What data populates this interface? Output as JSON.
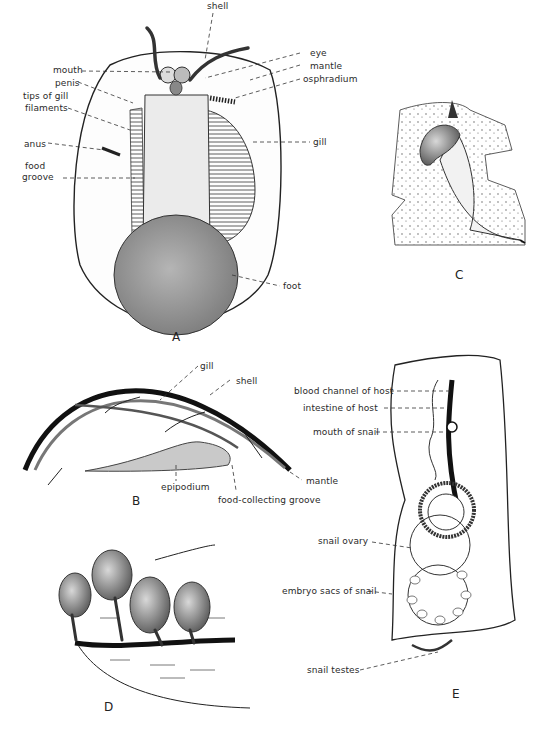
{
  "figure": {
    "panels": {
      "A": {
        "letter": "A",
        "labels": {
          "shell": "shell",
          "eye": "eye",
          "mantle": "mantle",
          "osphradium": "osphradium",
          "mouth": "mouth",
          "penis": "penis",
          "tips_line1": "tips of gill",
          "tips_line2": "filaments",
          "anus": "anus",
          "food_line1": "food",
          "food_line2": "groove",
          "gill": "gill",
          "foot": "foot"
        }
      },
      "B": {
        "letter": "B",
        "labels": {
          "gill": "gill",
          "shell": "shell",
          "mantle": "mantle",
          "epipodium": "epipodium",
          "food_collecting_groove": "food-collecting groove"
        }
      },
      "C": {
        "letter": "C"
      },
      "D": {
        "letter": "D"
      },
      "E": {
        "letter": "E",
        "labels": {
          "blood_channel": "blood channel of host",
          "intestine": "intestine of host",
          "mouth_of_snail": "mouth of snail",
          "snail_ovary": "snail ovary",
          "embryo_sacs": "embryo sacs of snail",
          "snail_testes": "snail testes"
        }
      }
    },
    "colors": {
      "ink": "#1a1a1a",
      "stipple": "#8a8a8a",
      "foot_fill": "#9a9a9a",
      "body_fill": "#e6e6e6"
    }
  }
}
